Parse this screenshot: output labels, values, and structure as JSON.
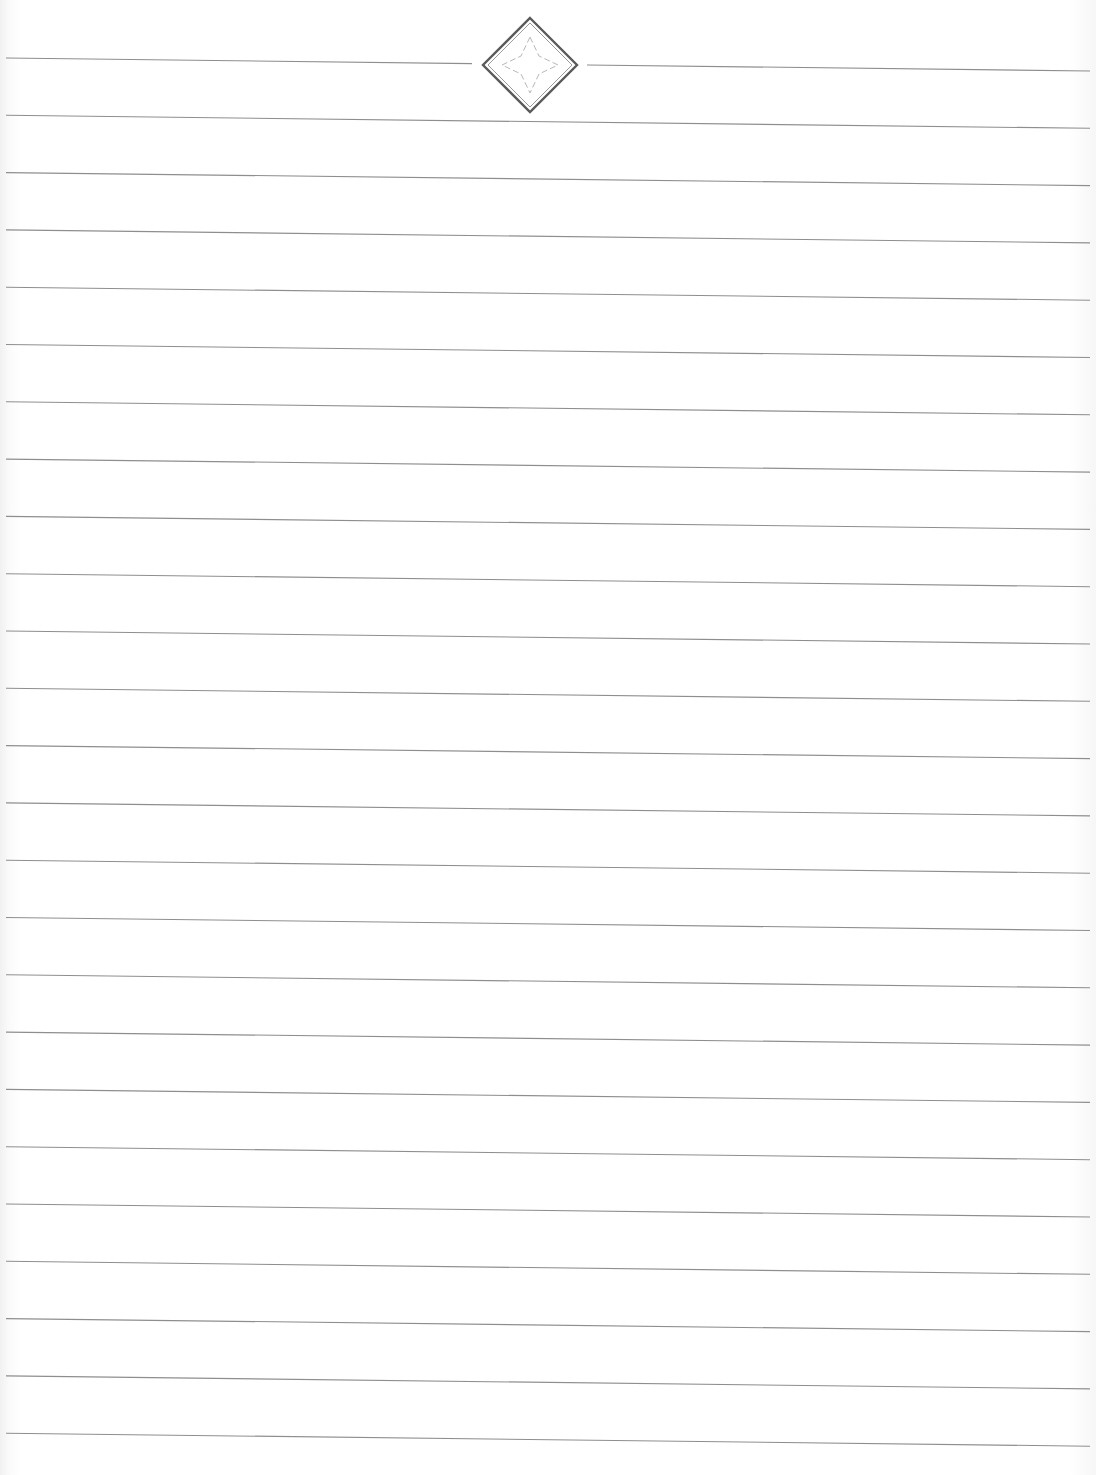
{
  "page": {
    "type": "ruled-notebook-page",
    "line_count": 25,
    "line_color": "#8e8e8e",
    "line_left_x": 6,
    "line_right_x": 1090,
    "first_line_left_y": 58,
    "line_spacing": 57.3,
    "line_slope_px": 13
  },
  "ornament": {
    "shape": "diamond-with-star",
    "center_x": 530,
    "center_y": 65,
    "half_diagonal": 47,
    "outer_color": "#5a5a5a",
    "inner_color": "#9a9a9a",
    "star_color": "#b8b8b8",
    "gap_left_x": 472,
    "gap_right_x": 587
  }
}
